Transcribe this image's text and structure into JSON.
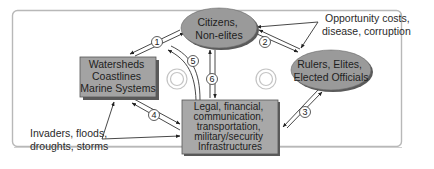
{
  "diagram": {
    "nodes": {
      "citizens": {
        "lines": [
          "Citizens,",
          "Non-elites"
        ],
        "shape": "ellipse",
        "fill": "#9a9a9a"
      },
      "rulers": {
        "lines": [
          "Rulers, Elites,",
          "Elected Officials"
        ],
        "shape": "ellipse",
        "fill": "#9a9a9a"
      },
      "watersheds": {
        "lines": [
          "Watersheds",
          "Coastlines",
          "Marine Systems"
        ],
        "shape": "box",
        "fill": "#a3a3a3"
      },
      "infrastructures": {
        "lines": [
          "Legal, financial,",
          "communication,",
          "transportation,",
          "military/security",
          "Infrastructures"
        ],
        "shape": "box",
        "fill": "#a8a8a8"
      }
    },
    "annotations": {
      "top_right": [
        "Opportunity costs,",
        "disease, corruption"
      ],
      "bottom_left": [
        "Invaders, floods,",
        "droughts, storms"
      ]
    },
    "edge_numbers": [
      "1",
      "2",
      "3",
      "4",
      "5",
      "6"
    ],
    "edges": [
      {
        "num": "1",
        "from": "citizens",
        "to": "watersheds",
        "bidirectional": true
      },
      {
        "num": "2",
        "from": "citizens",
        "to": "rulers",
        "bidirectional": true
      },
      {
        "num": "3",
        "from": "rulers",
        "to": "infrastructures",
        "bidirectional": true
      },
      {
        "num": "4",
        "from": "watersheds",
        "to": "infrastructures",
        "bidirectional": true
      },
      {
        "num": "5",
        "from": "infrastructures",
        "to": "citizens",
        "bidirectional": false
      },
      {
        "num": "6",
        "from": "citizens",
        "to": "infrastructures",
        "bidirectional": true
      }
    ],
    "colors": {
      "frame": "#b5b5b5",
      "line": "#333333",
      "node_border": "#555555",
      "shadow": "#5a5a5a"
    }
  }
}
